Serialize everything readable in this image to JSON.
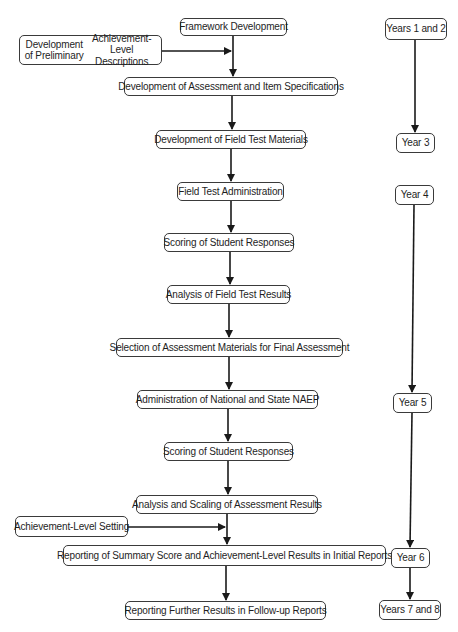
{
  "diagram": {
    "type": "flowchart",
    "main_flow": [
      {
        "id": "framework",
        "label": "Framework Development"
      },
      {
        "id": "assess_spec",
        "label": "Development of Assessment and Item Specifications"
      },
      {
        "id": "field_materials",
        "label": "Development of Field Test Materials"
      },
      {
        "id": "field_admin",
        "label": "Field Test Administration"
      },
      {
        "id": "scoring1",
        "label": "Scoring of Student Responses"
      },
      {
        "id": "analysis_field",
        "label": "Analysis  of Field Test Results"
      },
      {
        "id": "selection",
        "label": "Selection of Assessment Materials for Final Assessment"
      },
      {
        "id": "admin_naep",
        "label": "Administration of National and State NAEP"
      },
      {
        "id": "scoring2",
        "label": "Scoring of Student Responses"
      },
      {
        "id": "analysis_scaling",
        "label": "Analysis and Scaling of Assessment Results"
      },
      {
        "id": "report_initial",
        "label": "Reporting of Summary Score and Achievement-Level Results in Initial Reports"
      },
      {
        "id": "report_followup",
        "label": "Reporting Further Results in Follow-up Reports"
      }
    ],
    "side_inputs": [
      {
        "id": "prelim",
        "label_line1": "Development of Preliminary",
        "label_line2": "Achievement-Level Descriptions",
        "feeds_into": "assess_spec"
      },
      {
        "id": "al_setting",
        "label": "Achievement-Level Setting",
        "feeds_into": "report_initial"
      }
    ],
    "timeline": [
      {
        "id": "y12",
        "label": "Years 1 and 2"
      },
      {
        "id": "y3",
        "label": "Year 3"
      },
      {
        "id": "y4",
        "label": "Year 4"
      },
      {
        "id": "y5",
        "label": "Year 5"
      },
      {
        "id": "y6",
        "label": "Year 6"
      },
      {
        "id": "y78",
        "label": "Years 7 and 8"
      }
    ],
    "edges": [
      [
        "framework",
        "assess_spec"
      ],
      [
        "prelim",
        "assess_spec"
      ],
      [
        "assess_spec",
        "field_materials"
      ],
      [
        "field_materials",
        "field_admin"
      ],
      [
        "field_admin",
        "scoring1"
      ],
      [
        "scoring1",
        "analysis_field"
      ],
      [
        "analysis_field",
        "selection"
      ],
      [
        "selection",
        "admin_naep"
      ],
      [
        "admin_naep",
        "scoring2"
      ],
      [
        "scoring2",
        "analysis_scaling"
      ],
      [
        "analysis_scaling",
        "report_initial"
      ],
      [
        "al_setting",
        "report_initial"
      ],
      [
        "report_initial",
        "report_followup"
      ],
      [
        "y12",
        "y3"
      ],
      [
        "y4",
        "y5"
      ],
      [
        "y5",
        "y6"
      ],
      [
        "y6",
        "y78"
      ]
    ],
    "colors": {
      "line": "#1a1a1a",
      "box_border": "#3a3a3a",
      "text": "#1e1e1e",
      "background": "#ffffff"
    }
  }
}
